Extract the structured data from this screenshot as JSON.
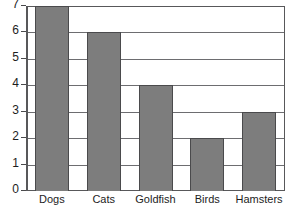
{
  "chart_data": {
    "type": "bar",
    "title": "",
    "subtitle": "",
    "xlabel": "",
    "ylabel": "",
    "categories": [
      "Dogs",
      "Cats",
      "Goldfish",
      "Birds",
      "Hamsters"
    ],
    "values": [
      7,
      6,
      4,
      2,
      3
    ],
    "ylim": [
      0,
      7
    ],
    "ytick_labels": [
      "0",
      "1",
      "2",
      "3",
      "4",
      "5",
      "6",
      "7"
    ],
    "ytick_values": [
      0,
      1,
      2,
      3,
      4,
      5,
      6,
      7
    ],
    "grid": "horizontal",
    "legend": "none",
    "annotations": [],
    "colors": {
      "bar_fill": "#7d7d7d",
      "bar_stroke": "#4a4a4c",
      "gridline": "#6d6d70",
      "axis": "#58585a",
      "text": "#1d1d1d",
      "background": "#ffffff"
    }
  }
}
